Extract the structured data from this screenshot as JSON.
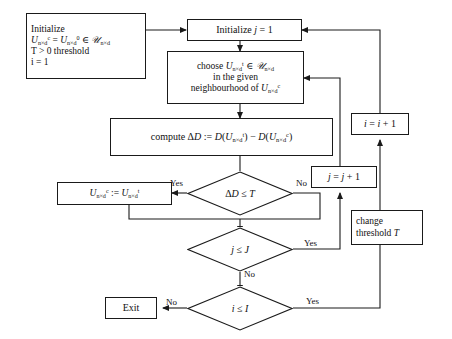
{
  "diagram": {
    "type": "flowchart",
    "canvas": {
      "width": 452,
      "height": 339
    },
    "stroke_color": "#1a1a1a",
    "background_color": "#ffffff"
  },
  "nodes": {
    "initialize_main": {
      "shape": "process",
      "lines": [
        "Initialize",
        "U^c_{n×d} = U^0_{n×d} ∈ ᴐ_{n×d}",
        "T > 0 threshold",
        "i = 1"
      ],
      "line1": "Initialize",
      "line3": "T > 0 threshold",
      "line4": "i = 1"
    },
    "initialize_j": {
      "shape": "process",
      "label": "Initialize j = 1"
    },
    "choose_u": {
      "shape": "process",
      "line1": "choose U^t_{n×d} ∈ ᴐ_{n×d}",
      "line2": "in the given",
      "line3": "neighbourhood of U^c_{n×d}"
    },
    "compute_dd": {
      "shape": "process",
      "label": "compute ΔD := D(U_{n×d}^t) − D(U_{n×d}^c)"
    },
    "assign_uc": {
      "shape": "process",
      "label": "U^c_{n×d} := U^t_{n×d}"
    },
    "decision_dd": {
      "shape": "decision",
      "label": "ΔD ≤ T"
    },
    "decision_j": {
      "shape": "decision",
      "label": "j ≤ J"
    },
    "decision_i": {
      "shape": "decision",
      "label": "i ≤ I"
    },
    "increment_j": {
      "shape": "process",
      "label": "j = j + 1"
    },
    "increment_i": {
      "shape": "process",
      "label": "i = i + 1"
    },
    "change_threshold": {
      "shape": "process",
      "line1": "change",
      "line2": "threshold T"
    },
    "exit": {
      "shape": "terminal",
      "label": "Exit"
    }
  },
  "edge_labels": {
    "dd_yes": "Yes",
    "dd_no": "No",
    "j_yes": "Yes",
    "j_no": "No",
    "i_yes": "Yes",
    "i_no": "No"
  }
}
